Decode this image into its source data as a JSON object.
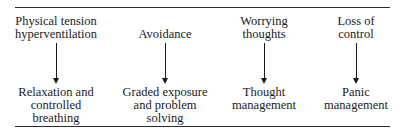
{
  "diagram": {
    "columns": [
      {
        "cause": [
          "Physical tension",
          "hyperventilation"
        ],
        "treatment": [
          "Relaxation and",
          "controlled",
          "breathing"
        ]
      },
      {
        "cause": [
          "Avoidance"
        ],
        "treatment": [
          "Graded exposure",
          "and problem",
          "solving"
        ]
      },
      {
        "cause": [
          "Worrying",
          "thoughts"
        ],
        "treatment": [
          "Thought",
          "management"
        ]
      },
      {
        "cause": [
          "Loss of",
          "control"
        ],
        "treatment": [
          "Panic",
          "management"
        ]
      }
    ]
  }
}
